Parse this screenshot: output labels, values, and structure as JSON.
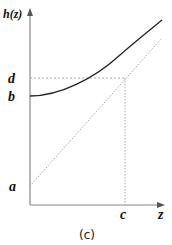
{
  "diagram": {
    "caption": "(c)",
    "y_axis_label": "h(z)",
    "x_axis_label": "z",
    "labels": {
      "a": "a",
      "b": "b",
      "c": "c",
      "d": "d"
    },
    "elements": [
      {
        "type": "axis",
        "name": "y-axis",
        "label": "h(z)"
      },
      {
        "type": "axis",
        "name": "x-axis",
        "label": "z"
      },
      {
        "type": "curve",
        "name": "h-curve",
        "style": "solid",
        "starts_at": "b"
      },
      {
        "type": "line",
        "name": "diagonal-line",
        "style": "dotted",
        "starts_at": "a"
      },
      {
        "type": "line",
        "name": "d-guide",
        "style": "dashed",
        "from": "d",
        "to": "intersection"
      },
      {
        "type": "line",
        "name": "c-guide",
        "style": "dotted",
        "from": "intersection",
        "to": "c"
      }
    ],
    "colors": {
      "axis": "#888888",
      "curve": "#222222",
      "dotted": "#aaaaaa",
      "text": "#111111"
    }
  }
}
